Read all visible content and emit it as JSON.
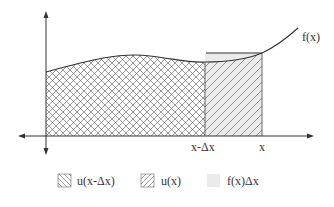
{
  "diagram": {
    "curve_label": "f(x)",
    "x_ticks": [
      {
        "label": "x-Δx",
        "x": 205
      },
      {
        "label": "x",
        "x": 262
      }
    ],
    "regions": [
      {
        "name": "u(x-Δx)",
        "pattern": "crosshatch",
        "from": 46,
        "to": 205
      },
      {
        "name": "u(x)",
        "pattern": "forward-hatch",
        "from": 205,
        "to": 262
      },
      {
        "name": "f(x)Δx",
        "pattern": "gray-fill"
      }
    ]
  },
  "legend": {
    "items": [
      {
        "label": "u(x-Δx)",
        "pattern": "back-hatch"
      },
      {
        "label": "u(x)",
        "pattern": "forward-hatch"
      },
      {
        "label": "f(x)Δx",
        "pattern": "gray-fill"
      }
    ]
  },
  "colors": {
    "line": "#333333",
    "hatch": "#555555",
    "gray_fill": "#e8e8e8"
  }
}
